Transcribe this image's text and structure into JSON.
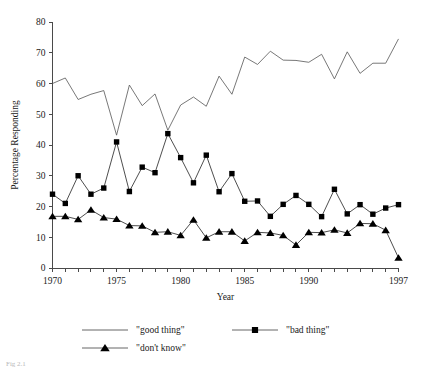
{
  "chart_data": {
    "type": "line",
    "title": "",
    "xlabel": "Year",
    "ylabel": "Percentage Responding",
    "xlim": [
      1970,
      1997
    ],
    "ylim": [
      0,
      80
    ],
    "ytick_values": [
      0,
      10,
      20,
      30,
      40,
      50,
      60,
      70,
      80
    ],
    "ytick_labels": [
      "0",
      "10",
      "20",
      "30",
      "40",
      "50",
      "60",
      "70",
      "80"
    ],
    "xtick_values": [
      1970,
      1971,
      1972,
      1973,
      1974,
      1975,
      1976,
      1977,
      1978,
      1979,
      1980,
      1981,
      1982,
      1983,
      1984,
      1985,
      1986,
      1987,
      1988,
      1989,
      1990,
      1991,
      1992,
      1993,
      1994,
      1995,
      1996,
      1997
    ],
    "xtick_labeled": [
      {
        "value": 1970,
        "label": "1970"
      },
      {
        "value": 1975,
        "label": "1975"
      },
      {
        "value": 1980,
        "label": "1980"
      },
      {
        "value": 1985,
        "label": "1985"
      },
      {
        "value": 1990,
        "label": "1990"
      },
      {
        "value": 1997,
        "label": "1997"
      }
    ],
    "grid": false,
    "legend_position": "below-axes",
    "x": [
      1970,
      1971,
      1972,
      1973,
      1974,
      1975,
      1976,
      1977,
      1978,
      1979,
      1980,
      1981,
      1982,
      1983,
      1984,
      1985,
      1986,
      1987,
      1988,
      1989,
      1990,
      1991,
      1992,
      1993,
      1994,
      1995,
      1996,
      1997
    ],
    "series": [
      {
        "name": "\"good thing\"",
        "marker": "none",
        "values": [
          60.0,
          61.8,
          54.8,
          56.5,
          57.7,
          43.2,
          59.5,
          52.8,
          56.6,
          44.8,
          53.0,
          55.6,
          52.6,
          62.4,
          56.5,
          68.6,
          66.2,
          70.5,
          67.6,
          67.5,
          66.9,
          69.5,
          61.5,
          70.3,
          63.3,
          66.6,
          66.6,
          74.5
        ]
      },
      {
        "name": "\"bad thing\"",
        "marker": "square",
        "values": [
          24.0,
          21.0,
          30.0,
          24.0,
          26.0,
          41.0,
          24.9,
          32.8,
          31.0,
          43.7,
          35.9,
          27.7,
          36.7,
          24.8,
          30.7,
          21.7,
          21.8,
          16.8,
          20.7,
          23.6,
          20.7,
          16.7,
          25.6,
          17.6,
          20.6,
          17.5,
          19.5,
          20.6
        ]
      },
      {
        "name": "\"don't know\"",
        "marker": "triangle",
        "values": [
          16.8,
          16.8,
          15.8,
          18.9,
          16.4,
          15.9,
          13.8,
          13.7,
          11.6,
          11.8,
          10.6,
          15.7,
          9.8,
          11.8,
          11.8,
          8.8,
          11.6,
          11.4,
          10.6,
          7.5,
          11.6,
          11.5,
          12.4,
          11.4,
          14.5,
          14.4,
          12.3,
          3.3
        ]
      }
    ]
  },
  "legend": {
    "entries": [
      {
        "label": "\"good thing\"",
        "marker": "none"
      },
      {
        "label": "\"bad thing\"",
        "marker": "square"
      },
      {
        "label": "\"don't know\"",
        "marker": "triangle"
      }
    ]
  },
  "caption": {
    "text": "Fig 2.1"
  }
}
